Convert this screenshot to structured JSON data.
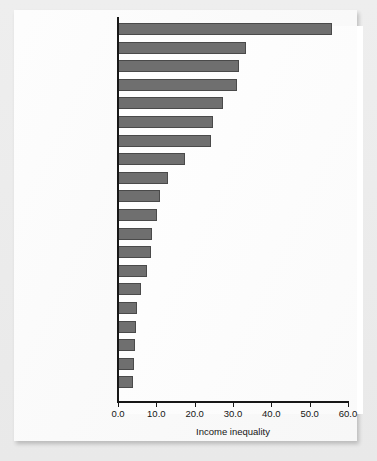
{
  "chart_data": {
    "type": "bar",
    "orientation": "horizontal",
    "title": "",
    "xlabel": "Income inequality",
    "ylabel": "",
    "xlim": [
      0.0,
      60.0
    ],
    "xticks": [
      "0.0",
      "10.0",
      "20.0",
      "30.0",
      "40.0",
      "50.0",
      "60.0"
    ],
    "xtick_values": [
      0,
      10,
      20,
      30,
      40,
      50,
      60
    ],
    "grid": false,
    "legend": false,
    "bar_color": "#6f6f6f",
    "bar_edge_color": "#4a4a4a",
    "categories": [
      "Namibia",
      "South Africa",
      "Botswana",
      "Brazil",
      "Paraguay",
      "Panama",
      "Swaziland",
      "Ecuador",
      "Nigeria",
      "People's Republic\nof China",
      "Hong Kong, China",
      "United States",
      "Portugal",
      "United Kingdom",
      "Canada",
      "India",
      "Ethiopia",
      "Germany",
      "Czech Republic",
      "Japan"
    ],
    "values": [
      55.8,
      33.5,
      31.6,
      31.1,
      27.4,
      24.8,
      24.3,
      17.5,
      13.1,
      11.0,
      10.2,
      8.9,
      8.6,
      7.6,
      5.9,
      4.9,
      4.6,
      4.5,
      4.1,
      3.9
    ]
  },
  "axis": {
    "x_title": "Income inequality"
  }
}
